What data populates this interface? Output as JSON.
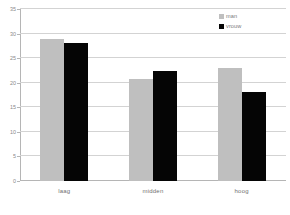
{
  "chart_data": {
    "type": "bar",
    "title": "",
    "xlabel": "",
    "ylabel": "",
    "categories": [
      "laag",
      "midden",
      "hoog"
    ],
    "series": [
      {
        "name": "man",
        "color": "#bfbfbf",
        "values": [
          28.8,
          20.8,
          23.0
        ]
      },
      {
        "name": "vrouw",
        "color": "#050505",
        "values": [
          28.1,
          22.3,
          18.2
        ]
      }
    ],
    "ylim": [
      0,
      35
    ],
    "ytick_step": 5,
    "yticks": [
      0,
      5,
      10,
      15,
      20,
      25,
      30,
      35
    ],
    "ytick_labels": [
      "0",
      "5",
      "10",
      "15",
      "20",
      "25",
      "30",
      "35"
    ],
    "grid": true,
    "grid_axis": "y",
    "legend_position": "top-right",
    "legend_entries": [
      "man",
      "vrouw"
    ],
    "background_color": "#ffffff",
    "gridline_color": "#d3d3d3",
    "axis_color": "#b5b5b5",
    "tick_label_color": "#8a8a8a",
    "category_label_color": "#6f6f6f"
  }
}
